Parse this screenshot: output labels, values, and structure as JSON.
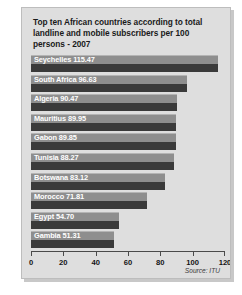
{
  "chart_data": {
    "type": "bar",
    "orientation": "horizontal",
    "title": "Top ten African countries according to total landline and mobile subscribers per 100 persons - 2007",
    "xlabel": "",
    "ylabel": "",
    "xlim": [
      0,
      120
    ],
    "xticks": [
      0,
      20,
      40,
      60,
      80,
      100,
      120
    ],
    "xtick_labels": [
      "0",
      "20",
      "40",
      "60",
      "80",
      "100",
      "120"
    ],
    "grid": false,
    "legend": false,
    "categories": [
      "Seychelles",
      "South Africa",
      "Algeria",
      "Mauritius",
      "Gabon",
      "Tunisia",
      "Botswana",
      "Morocco",
      "Egypt",
      "Gambia"
    ],
    "values": [
      115.47,
      96.63,
      90.47,
      89.95,
      89.85,
      88.27,
      83.12,
      71.81,
      54.7,
      51.31
    ],
    "bar_labels": [
      "Seychelles 115.47",
      "South Africa 96.63",
      "Algeria 90.47",
      "Mauritius 89.95",
      "Gabon 89.85",
      "Tunisia 88.27",
      "Botswana 83.12",
      "Morocco 71.81",
      "Egypt 54.70",
      "Gambia 51.31"
    ],
    "annotations": [
      "Source: ITU"
    ],
    "colors": {
      "bar_top": "#8e8e8e",
      "bar_bottom": "#3a3a3a",
      "panel_background": "#dedede",
      "label_text": "#ffffff",
      "axis": "#4a4a4a"
    }
  },
  "source_note": "Source: ITU"
}
